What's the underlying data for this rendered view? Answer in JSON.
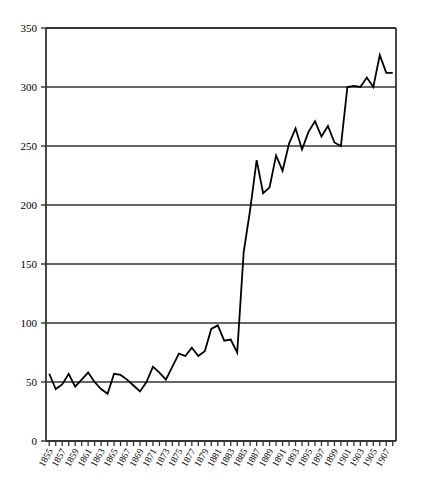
{
  "chart_data": {
    "type": "line",
    "title": "",
    "subtitle": "",
    "xlabel": "",
    "ylabel": "",
    "xlim": [
      1854.5,
      1908.5
    ],
    "ylim": [
      0,
      350
    ],
    "grid": "horizontal",
    "legend": "none",
    "y_ticks": [
      0,
      50,
      100,
      150,
      200,
      250,
      300,
      350
    ],
    "x_tick_labels": [
      "1855",
      "1857",
      "1859",
      "1861",
      "1863",
      "1865",
      "1867",
      "1869",
      "1871",
      "1873",
      "1875",
      "1877",
      "1879",
      "1881",
      "1883",
      "1885",
      "1887",
      "1889",
      "1891",
      "1893",
      "1895",
      "1897",
      "1899",
      "1901",
      "1903",
      "1905",
      "1907"
    ],
    "x_tick_label_rotation": -60,
    "x_minor_ticks_every": 1,
    "line_color": "#000000",
    "line_width": 1.8,
    "x": [
      1855,
      1856,
      1857,
      1858,
      1859,
      1860,
      1861,
      1862,
      1863,
      1864,
      1865,
      1866,
      1867,
      1868,
      1869,
      1870,
      1871,
      1872,
      1873,
      1874,
      1875,
      1876,
      1877,
      1878,
      1879,
      1880,
      1881,
      1882,
      1883,
      1884,
      1885,
      1886,
      1887,
      1888,
      1889,
      1890,
      1891,
      1892,
      1893,
      1894,
      1895,
      1896,
      1897,
      1898,
      1899,
      1900,
      1901,
      1902,
      1903,
      1904,
      1905,
      1906,
      1907,
      1908
    ],
    "values": [
      57,
      44,
      48,
      57,
      46,
      52,
      58,
      50,
      44,
      40,
      57,
      56,
      52,
      47,
      42,
      50,
      63,
      58,
      52,
      63,
      74,
      72,
      79,
      72,
      76,
      95,
      98,
      85,
      86,
      75,
      160,
      196,
      238,
      210,
      215,
      242,
      229,
      252,
      265,
      247,
      262,
      271,
      258,
      267,
      253,
      250,
      300,
      301,
      300,
      308,
      300,
      327,
      312,
      312
    ],
    "series": [
      {
        "name": "value",
        "values": [
          57,
          44,
          48,
          57,
          46,
          52,
          58,
          50,
          44,
          40,
          57,
          56,
          52,
          47,
          42,
          50,
          63,
          58,
          52,
          63,
          74,
          72,
          79,
          72,
          76,
          95,
          98,
          85,
          86,
          75,
          160,
          196,
          238,
          210,
          215,
          242,
          229,
          252,
          265,
          247,
          262,
          271,
          258,
          267,
          253,
          250,
          300,
          301,
          300,
          308,
          300,
          327,
          312,
          312
        ]
      }
    ]
  },
  "axes": {
    "y_axis_name": "y-axis",
    "x_axis_name": "x-axis"
  }
}
